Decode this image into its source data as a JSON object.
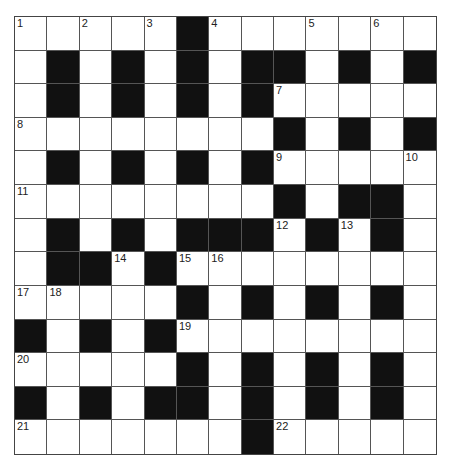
{
  "puzzle": {
    "rows": 13,
    "cols": 13,
    "colors": {
      "block": "#111111",
      "cell": "#ffffff",
      "line": "#555555"
    },
    "grid": [
      "WWWWWBWWWWWWW",
      "WBWBWBWBBWBWB",
      "WBWBWBWBWWWWW",
      "WWWWWWWWBWBWB",
      "WBWBWBWBWWWWW",
      "WWWWWWWWBWBBW",
      "WBWBWBBBWBWBW",
      "WBBWBWWWWWWWW",
      "WWWWWBWBWBWBW",
      "BWBWBWWWWWWWW",
      "WWWWWBWBWBWBW",
      "BWBWBBWBWBWBW",
      "WWWWWWWBWWWWW"
    ],
    "numbers": [
      {
        "r": 0,
        "c": 0,
        "n": "1"
      },
      {
        "r": 0,
        "c": 2,
        "n": "2"
      },
      {
        "r": 0,
        "c": 4,
        "n": "3"
      },
      {
        "r": 0,
        "c": 6,
        "n": "4"
      },
      {
        "r": 0,
        "c": 9,
        "n": "5"
      },
      {
        "r": 0,
        "c": 11,
        "n": "6"
      },
      {
        "r": 2,
        "c": 8,
        "n": "7"
      },
      {
        "r": 3,
        "c": 0,
        "n": "8"
      },
      {
        "r": 4,
        "c": 8,
        "n": "9"
      },
      {
        "r": 4,
        "c": 12,
        "n": "10"
      },
      {
        "r": 5,
        "c": 0,
        "n": "11"
      },
      {
        "r": 6,
        "c": 8,
        "n": "12"
      },
      {
        "r": 6,
        "c": 10,
        "n": "13"
      },
      {
        "r": 7,
        "c": 3,
        "n": "14"
      },
      {
        "r": 7,
        "c": 5,
        "n": "15"
      },
      {
        "r": 7,
        "c": 6,
        "n": "16"
      },
      {
        "r": 8,
        "c": 0,
        "n": "17"
      },
      {
        "r": 8,
        "c": 1,
        "n": "18"
      },
      {
        "r": 9,
        "c": 5,
        "n": "19"
      },
      {
        "r": 10,
        "c": 0,
        "n": "20"
      },
      {
        "r": 12,
        "c": 0,
        "n": "21"
      },
      {
        "r": 12,
        "c": 8,
        "n": "22"
      }
    ]
  }
}
